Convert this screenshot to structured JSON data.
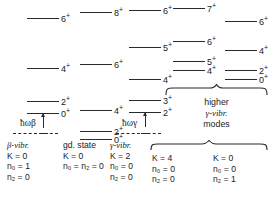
{
  "figure": {
    "type": "energy-level-diagram"
  },
  "chart_data": {
    "type": "table",
    "xlabel": "",
    "ylabel": "Energy",
    "columns": [
      {
        "id": "beta-vibr",
        "caption_lines": [
          "β-vibr.",
          "K = 0",
          "n₀ = 1",
          "n₂ = 0"
        ],
        "K": "0",
        "n0": "1",
        "n2": "0",
        "has_omega_arrow": true,
        "omega_label": "ħωβ",
        "levels": [
          {
            "spin": "6",
            "parity": "+",
            "y": 18
          },
          {
            "spin": "4",
            "parity": "+",
            "y": 68
          },
          {
            "spin": "2",
            "parity": "+",
            "y": 101
          },
          {
            "spin": "0",
            "parity": "+",
            "y": 113
          }
        ]
      },
      {
        "id": "gd-state",
        "caption_lines": [
          "gd. state",
          "K = 0",
          "n₀ = n₂ = 0"
        ],
        "K": "0",
        "n0": "0",
        "n2": "0",
        "has_omega_arrow": false,
        "omega_label": "",
        "levels": [
          {
            "spin": "8",
            "parity": "+",
            "y": 12
          },
          {
            "spin": "6",
            "parity": "+",
            "y": 64
          },
          {
            "spin": "4",
            "parity": "+",
            "y": 110
          },
          {
            "spin": "2",
            "parity": "+",
            "y": 131
          },
          {
            "spin": "0",
            "parity": "+",
            "y": 139
          }
        ]
      },
      {
        "id": "gamma-vibr",
        "caption_lines": [
          "γ-vibr.",
          "K = 2",
          "n₀ = 0",
          "n₂ = 0"
        ],
        "K": "2",
        "n0": "0",
        "n2": "0",
        "has_omega_arrow": true,
        "omega_label": "ħωγ",
        "levels": [
          {
            "spin": "6",
            "parity": "+",
            "y": 10
          },
          {
            "spin": "5",
            "parity": "+",
            "y": 47
          },
          {
            "spin": "4",
            "parity": "+",
            "y": 79
          },
          {
            "spin": "3",
            "parity": "+",
            "y": 100
          },
          {
            "spin": "2",
            "parity": "+",
            "y": 112
          }
        ]
      },
      {
        "id": "higher-K4",
        "caption_lines": [
          "K = 4",
          "n₀ = 0",
          "n₂ = 0"
        ],
        "K": "4",
        "n0": "0",
        "n2": "0",
        "has_omega_arrow": false,
        "omega_label": "",
        "levels": [
          {
            "spin": "7",
            "parity": "+",
            "y": 8
          },
          {
            "spin": "6",
            "parity": "+",
            "y": 41
          },
          {
            "spin": "5",
            "parity": "+",
            "y": 61
          },
          {
            "spin": "4",
            "parity": "+",
            "y": 70
          }
        ]
      },
      {
        "id": "higher-K0",
        "caption_lines": [
          "K = 0",
          "n₀ = 0",
          "n₂ = 1"
        ],
        "K": "0",
        "n0": "0",
        "n2": "1",
        "has_omega_arrow": false,
        "omega_label": "",
        "levels": [
          {
            "spin": "6",
            "parity": "+",
            "y": 21
          },
          {
            "spin": "4",
            "parity": "+",
            "y": 50
          },
          {
            "spin": "2",
            "parity": "+",
            "y": 70
          },
          {
            "spin": "0",
            "parity": "+",
            "y": 79
          }
        ]
      }
    ],
    "group_annotation": {
      "lines": [
        "higher",
        "γ-vibr.",
        "modes"
      ]
    }
  },
  "labels": {
    "col1_caption": "β-vibr.",
    "col1_K": "K = 0",
    "col1_n0": "n₀ = 1",
    "col1_n2": "n₂ = 0",
    "col2_caption": "gd. state",
    "col2_K": "K = 0",
    "col2_n": "n₀ = n₂ = 0",
    "col3_caption": "γ-vibr.",
    "col3_K": "K = 2",
    "col3_n0": "n₀ = 0",
    "col3_n2": "n₂ = 0",
    "col4_K": "K = 4",
    "col4_n0": "n₀ = 0",
    "col4_n2": "n₂ = 0",
    "col5_K": "K = 0",
    "col5_n0": "n₀ = 0",
    "col5_n2": "n₂ = 1",
    "omega_beta": "ħωβ",
    "omega_gamma": "ħωγ",
    "group_line1": "higher",
    "group_line2": "γ-vibr.",
    "group_line3": "modes"
  },
  "colors": {
    "ink": "#1a1a1a",
    "line": "#2a2a2a",
    "background": "#ffffff"
  }
}
